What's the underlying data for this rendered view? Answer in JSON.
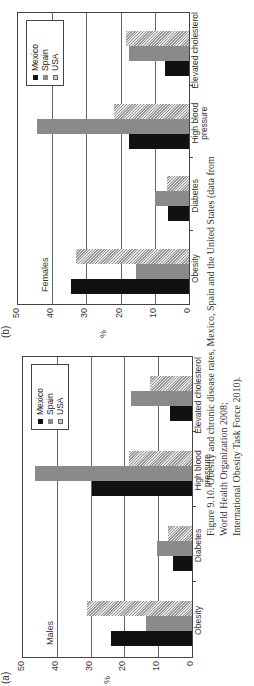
{
  "figure": {
    "caption_line1": "Figure 9.10. Obesity and chronic disease rates, Mexico, Spain and the United States (data from World Health Organization 2008;",
    "caption_line2": "International Obesity Task Force 2010)."
  },
  "panels": [
    {
      "label": "(a)",
      "sex": "Males",
      "ylabel": "%",
      "yticks": [
        "0",
        "10",
        "20",
        "30",
        "40",
        "50"
      ],
      "categories": [
        "Obesity",
        "Diabetes",
        "High blood pressure",
        "Elevated cholesterol"
      ],
      "legend": [
        "Mexico",
        "Spain",
        "USA"
      ]
    },
    {
      "label": "(b)",
      "sex": "Females",
      "ylabel": "%",
      "yticks": [
        "0",
        "10",
        "20",
        "30",
        "40",
        "50"
      ],
      "categories": [
        "Obesity",
        "Diabetes",
        "High blood pressure",
        "Elevated cholesterol"
      ],
      "legend": [
        "Mexico",
        "Spain",
        "USA"
      ]
    }
  ],
  "colors": {
    "mexico": "#111111",
    "spain": "#8a8a8a",
    "usa": "#c8c8c8"
  },
  "chart_data": [
    {
      "type": "bar",
      "title": "(a) Males",
      "xlabel": "",
      "ylabel": "%",
      "ylim": [
        0,
        50
      ],
      "yticks": [
        0,
        10,
        20,
        30,
        40,
        50
      ],
      "grid": true,
      "legend_position": "upper right",
      "categories": [
        "Obesity",
        "Diabetes",
        "High blood pressure",
        "Elevated cholesterol"
      ],
      "series": [
        {
          "name": "Mexico",
          "values": [
            24,
            5.5,
            29.5,
            6.5
          ]
        },
        {
          "name": "Spain",
          "values": [
            13.5,
            10.5,
            46.5,
            18
          ]
        },
        {
          "name": "USA",
          "values": [
            31,
            7,
            18.5,
            12.5
          ]
        }
      ]
    },
    {
      "type": "bar",
      "title": "(b) Females",
      "xlabel": "",
      "ylabel": "%",
      "ylim": [
        0,
        50
      ],
      "yticks": [
        0,
        10,
        20,
        30,
        40,
        50
      ],
      "grid": true,
      "legend_position": "upper right",
      "categories": [
        "Obesity",
        "Diabetes",
        "High blood pressure",
        "Elevated cholesterol"
      ],
      "series": [
        {
          "name": "Mexico",
          "values": [
            34.5,
            6,
            17.5,
            7
          ]
        },
        {
          "name": "Spain",
          "values": [
            15.5,
            10,
            44.5,
            17.5
          ]
        },
        {
          "name": "USA",
          "values": [
            33,
            6.5,
            22,
            18.5
          ]
        }
      ]
    }
  ]
}
